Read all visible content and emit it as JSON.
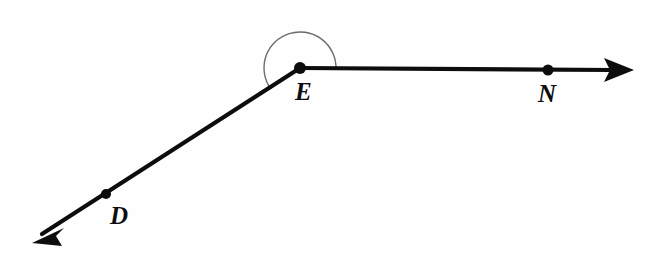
{
  "diagram": {
    "kind": "geometry-angle-diagram",
    "background_color": "#fefefe",
    "stroke_color": "#0d0d0d",
    "arc_color": "#6b6b6b",
    "points": [
      {
        "id": "E",
        "label": "E",
        "x": 300,
        "y": 68,
        "dot_radius": 5.5,
        "label_x": 295,
        "label_y": 79
      },
      {
        "id": "D",
        "label": "D",
        "x": 106,
        "y": 194,
        "dot_radius": 4.5,
        "label_x": 110,
        "label_y": 203
      },
      {
        "id": "N",
        "label": "N",
        "x": 548,
        "y": 70,
        "dot_radius": 5.5,
        "label_x": 538,
        "label_y": 81
      }
    ],
    "rays": [
      {
        "id": "ray-ED",
        "from_x": 300,
        "from_y": 68,
        "to_x": 40,
        "to_y": 236,
        "arrow_tip_x": 32,
        "arrow_tip_y": 243,
        "stroke_width": 4.2,
        "has_arrowhead": true
      },
      {
        "id": "ray-EN",
        "from_x": 300,
        "from_y": 68,
        "to_x": 614,
        "to_y": 70,
        "arrow_tip_x": 634,
        "arrow_tip_y": 70,
        "stroke_width": 4.2,
        "has_arrowhead": true
      }
    ],
    "arc": {
      "id": "angle-arc-E",
      "center_x": 300,
      "center_y": 68,
      "radius": 36,
      "start_x": 270.8,
      "start_y": 89.0,
      "end_x": 336.0,
      "end_y": 68.6,
      "sweep_description": "counterclockwise over the top from the ED ray to the EN ray",
      "stroke_width": 1.4
    },
    "arrowheads": [
      {
        "id": "arrowhead-D",
        "tip_x": 32,
        "tip_y": 243,
        "length": 30,
        "half_width": 9
      },
      {
        "id": "arrowhead-N",
        "tip_x": 634,
        "tip_y": 70,
        "length": 30,
        "half_width": 9
      }
    ]
  }
}
